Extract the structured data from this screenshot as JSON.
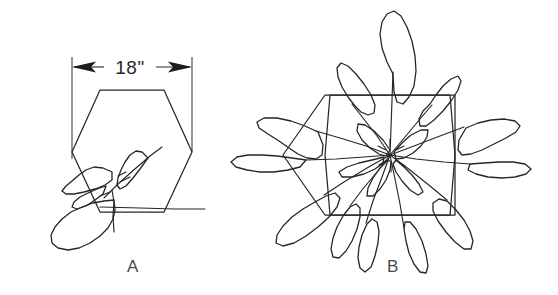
{
  "figure": {
    "background_color": "#ffffff",
    "line_color": "#272727",
    "width": 558,
    "height": 295,
    "type": "technical-line-drawing"
  },
  "dimension": {
    "value_label": "18\"",
    "units": "inches",
    "measure": 18,
    "orientation": "horizontal",
    "arrow_style": "outward-pointing-solid",
    "extension_line_left_x": 72,
    "extension_line_right_x": 192,
    "dimension_line_y": 67
  },
  "panels": [
    {
      "id": "A",
      "label": "A",
      "label_x": 133,
      "label_y": 272,
      "description": "young seedling with few small leaves inside hexagon cell",
      "hexagon": {
        "center_x": 132,
        "center_y": 151,
        "width": 120,
        "height": 122,
        "orientation": "flat-top"
      },
      "plant": {
        "leaf_count": 4,
        "coverage": "partial",
        "crown_x": 112,
        "crown_y": 180
      }
    },
    {
      "id": "B",
      "label": "B",
      "label_x": 393,
      "label_y": 272,
      "description": "mature plant with large leaves overflowing hexagon cell",
      "hexagon": {
        "center_x": 390,
        "center_y": 155,
        "width": 130,
        "height": 122,
        "orientation": "flat-top"
      },
      "plant": {
        "leaf_count": 13,
        "coverage": "full-overflow",
        "crown_x": 390,
        "crown_y": 155
      }
    }
  ]
}
